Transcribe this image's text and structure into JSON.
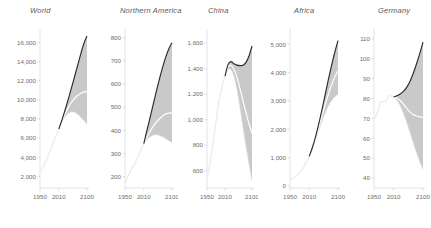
{
  "figure": {
    "background_color": "#ffffff",
    "panel_count": 5,
    "axis_color": "#d8d8d8",
    "band_color": "#c9c9c9",
    "upper_line_color": "#2b2b2b",
    "median_line_color": "#ffffff",
    "historical_line_color": "#eeeeee"
  },
  "chart_data": [
    {
      "type": "area",
      "title": "World",
      "xlabel": "",
      "ylabel": "",
      "xlim": [
        1950,
        2100
      ],
      "ylim": [
        1000,
        17000
      ],
      "xticks": [
        1950,
        2010,
        2100
      ],
      "xtick_labels": [
        "1950",
        "2010",
        "2100"
      ],
      "yticks": [
        2000,
        4000,
        6000,
        8000,
        10000,
        12000,
        14000,
        16000
      ],
      "ytick_labels": [
        "2,000",
        "4,000",
        "6,000",
        "8,000",
        "10,000",
        "12,000",
        "14,000",
        "16,000"
      ],
      "grid": false,
      "legend": "none",
      "series": [
        {
          "name": "historical",
          "x": [
            1950,
            1960,
            1970,
            1980,
            1990,
            2000,
            2010
          ],
          "values": [
            2536,
            3035,
            3700,
            4458,
            5327,
            6143,
            6957
          ]
        },
        {
          "name": "median",
          "x": [
            2010,
            2020,
            2030,
            2040,
            2050,
            2060,
            2070,
            2080,
            2090,
            2100
          ],
          "values": [
            6957,
            7795,
            8548,
            9198,
            9735,
            10152,
            10459,
            10674,
            10817,
            10875
          ]
        },
        {
          "name": "upper",
          "x": [
            2010,
            2020,
            2030,
            2040,
            2050,
            2060,
            2070,
            2080,
            2090,
            2100
          ],
          "values": [
            6957,
            7900,
            8950,
            10050,
            11200,
            12400,
            13600,
            14800,
            15900,
            16700
          ]
        },
        {
          "name": "lower",
          "x": [
            2010,
            2020,
            2030,
            2040,
            2050,
            2060,
            2070,
            2080,
            2090,
            2100
          ],
          "values": [
            6957,
            7700,
            8250,
            8600,
            8750,
            8700,
            8500,
            8200,
            7850,
            7500
          ]
        }
      ]
    },
    {
      "type": "area",
      "title": "Northern America",
      "xlabel": "",
      "ylabel": "",
      "xlim": [
        1950,
        2100
      ],
      "ylim": [
        160,
        820
      ],
      "xticks": [
        1950,
        2010,
        2100
      ],
      "xtick_labels": [
        "1950",
        "2010",
        "2100"
      ],
      "yticks": [
        200,
        300,
        400,
        500,
        600,
        700,
        800
      ],
      "ytick_labels": [
        "200",
        "300",
        "400",
        "500",
        "600",
        "700",
        "800"
      ],
      "grid": false,
      "legend": "none",
      "series": [
        {
          "name": "historical",
          "x": [
            1950,
            1960,
            1970,
            1980,
            1990,
            2000,
            2010
          ],
          "values": [
            172,
            204,
            231,
            254,
            282,
            313,
            343
          ]
        },
        {
          "name": "median",
          "x": [
            2010,
            2020,
            2030,
            2040,
            2050,
            2060,
            2070,
            2080,
            2090,
            2100
          ],
          "values": [
            343,
            370,
            395,
            417,
            435,
            450,
            462,
            470,
            474,
            476
          ]
        },
        {
          "name": "upper",
          "x": [
            2010,
            2020,
            2030,
            2040,
            2050,
            2060,
            2070,
            2080,
            2090,
            2100
          ],
          "values": [
            343,
            400,
            455,
            512,
            568,
            622,
            672,
            716,
            752,
            778
          ]
        },
        {
          "name": "lower",
          "x": [
            2010,
            2020,
            2030,
            2040,
            2050,
            2060,
            2070,
            2080,
            2090,
            2100
          ],
          "values": [
            343,
            360,
            372,
            379,
            381,
            378,
            372,
            364,
            355,
            348
          ]
        }
      ]
    },
    {
      "type": "area",
      "title": "China",
      "xlabel": "",
      "ylabel": "",
      "xlim": [
        1950,
        2100
      ],
      "ylim": [
        480,
        1680
      ],
      "xticks": [
        1950,
        2010,
        2100
      ],
      "xtick_labels": [
        "1950",
        "2010",
        "2100"
      ],
      "yticks": [
        600,
        800,
        1000,
        1200,
        1400,
        1600
      ],
      "ytick_labels": [
        "600",
        "800",
        "1,000",
        "1,200",
        "1,400",
        "1,600"
      ],
      "grid": false,
      "legend": "none",
      "series": [
        {
          "name": "historical",
          "x": [
            1950,
            1960,
            1970,
            1980,
            1990,
            2000,
            2010
          ],
          "values": [
            544,
            650,
            814,
            981,
            1145,
            1263,
            1341
          ]
        },
        {
          "name": "median",
          "x": [
            2010,
            2020,
            2030,
            2040,
            2050,
            2060,
            2070,
            2080,
            2090,
            2100
          ],
          "values": [
            1341,
            1412,
            1427,
            1395,
            1330,
            1243,
            1148,
            1054,
            968,
            895
          ]
        },
        {
          "name": "upper",
          "x": [
            2010,
            2020,
            2030,
            2040,
            2050,
            2060,
            2070,
            2080,
            2090,
            2100
          ],
          "values": [
            1341,
            1432,
            1455,
            1438,
            1428,
            1424,
            1428,
            1450,
            1500,
            1578
          ]
        },
        {
          "name": "lower",
          "x": [
            2010,
            2020,
            2030,
            2040,
            2050,
            2060,
            2070,
            2080,
            2090,
            2100
          ],
          "values": [
            1341,
            1392,
            1392,
            1338,
            1232,
            1092,
            938,
            790,
            648,
            520
          ]
        }
      ]
    },
    {
      "type": "area",
      "title": "Africa",
      "xlabel": "",
      "ylabel": "",
      "xlim": [
        1950,
        2100
      ],
      "ylim": [
        0,
        5400
      ],
      "xticks": [
        1950,
        2010,
        2100
      ],
      "xtick_labels": [
        "1950",
        "2010",
        "2100"
      ],
      "yticks": [
        0,
        1000,
        2000,
        3000,
        4000,
        5000
      ],
      "ytick_labels": [
        "0",
        "1,000",
        "2,000",
        "3,000",
        "4,000",
        "5,000"
      ],
      "grid": false,
      "legend": "none",
      "series": [
        {
          "name": "historical",
          "x": [
            1950,
            1960,
            1970,
            1980,
            1990,
            2000,
            2010
          ],
          "values": [
            229,
            285,
            366,
            478,
            632,
            818,
            1044
          ]
        },
        {
          "name": "median",
          "x": [
            2010,
            2020,
            2030,
            2040,
            2050,
            2060,
            2070,
            2080,
            2090,
            2100
          ],
          "values": [
            1044,
            1341,
            1688,
            2077,
            2478,
            2873,
            3243,
            3573,
            3851,
            4070
          ]
        },
        {
          "name": "upper",
          "x": [
            2010,
            2020,
            2030,
            2040,
            2050,
            2060,
            2070,
            2080,
            2090,
            2100
          ],
          "values": [
            1044,
            1360,
            1745,
            2200,
            2700,
            3230,
            3760,
            4260,
            4720,
            5130
          ]
        },
        {
          "name": "lower",
          "x": [
            2010,
            2020,
            2030,
            2040,
            2050,
            2060,
            2070,
            2080,
            2090,
            2100
          ],
          "values": [
            1044,
            1325,
            1635,
            1965,
            2285,
            2575,
            2820,
            3010,
            3150,
            3240
          ]
        }
      ]
    },
    {
      "type": "area",
      "title": "Germany",
      "xlabel": "",
      "ylabel": "",
      "xlim": [
        1950,
        2100
      ],
      "ylim": [
        36,
        113
      ],
      "xticks": [
        1950,
        2010,
        2100
      ],
      "xtick_labels": [
        "1950",
        "2010",
        "2100"
      ],
      "yticks": [
        40,
        50,
        60,
        70,
        80,
        90,
        100,
        110
      ],
      "ytick_labels": [
        "40",
        "50",
        "60",
        "70",
        "80",
        "90",
        "100",
        "110"
      ],
      "grid": false,
      "legend": "none",
      "series": [
        {
          "name": "historical",
          "x": [
            1950,
            1960,
            1970,
            1980,
            1990,
            1995,
            2000,
            2010
          ],
          "values": [
            69.8,
            72.8,
            78.2,
            78.3,
            79.4,
            81.7,
            81.4,
            80.8
          ]
        },
        {
          "name": "median",
          "x": [
            2010,
            2020,
            2030,
            2040,
            2050,
            2060,
            2070,
            2080,
            2090,
            2100
          ],
          "values": [
            80.8,
            80.2,
            79.0,
            77.2,
            75.1,
            73.3,
            72.0,
            71.2,
            70.8,
            70.6
          ]
        },
        {
          "name": "upper",
          "x": [
            2010,
            2020,
            2030,
            2040,
            2050,
            2060,
            2070,
            2080,
            2090,
            2100
          ],
          "values": [
            80.8,
            81.4,
            82.3,
            83.6,
            85.6,
            88.6,
            92.6,
            97.4,
            102.6,
            108.4
          ]
        },
        {
          "name": "lower",
          "x": [
            2010,
            2020,
            2030,
            2040,
            2050,
            2060,
            2070,
            2080,
            2090,
            2100
          ],
          "values": [
            80.8,
            79.2,
            76.4,
            72.6,
            68.0,
            63.0,
            57.8,
            52.8,
            48.2,
            44.2
          ]
        }
      ]
    }
  ]
}
